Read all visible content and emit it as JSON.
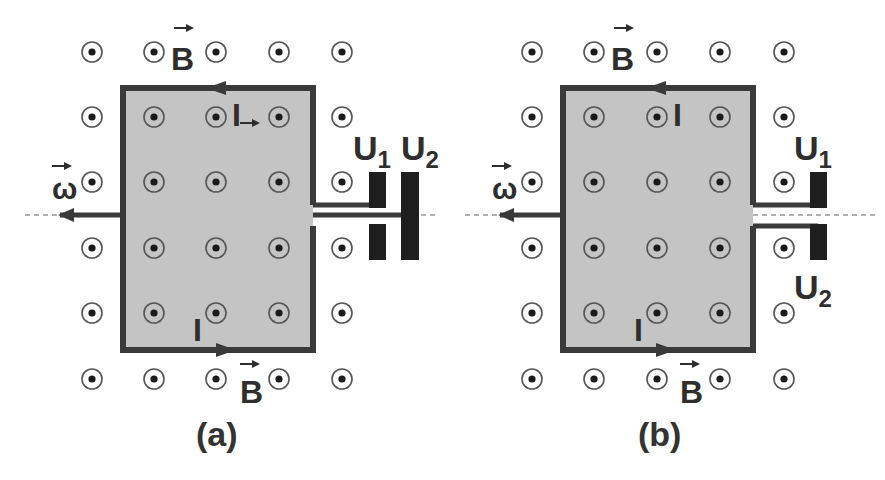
{
  "figure": {
    "colors": {
      "background": "#ffffff",
      "loop_fill": "#c4c4c4",
      "loop_stroke": "#3a3a3a",
      "electrode": "#1e1e1e",
      "dot_ring": "#555555",
      "dot_center": "#1a1a1a",
      "axis_dash": "#666666",
      "text": "#2e2e2e"
    },
    "field_symbol": "out-of-page (⊙)",
    "panels": [
      {
        "id": "a",
        "caption": "(a)",
        "labels": {
          "B_top": "B",
          "B_bottom": "B",
          "I_top": "I",
          "I_bottom": "I",
          "omega": "ω",
          "U1_main": "U",
          "U1_sub": "1",
          "U2_main": "U",
          "U2_sub": "2"
        }
      },
      {
        "id": "b",
        "caption": "(b)",
        "labels": {
          "B_top": "B",
          "B_bottom": "B",
          "I_top": "I",
          "I_bottom": "I",
          "omega": "ω",
          "U1_main": "U",
          "U1_sub": "1",
          "U2_main": "U",
          "U2_sub": "2"
        }
      }
    ]
  }
}
